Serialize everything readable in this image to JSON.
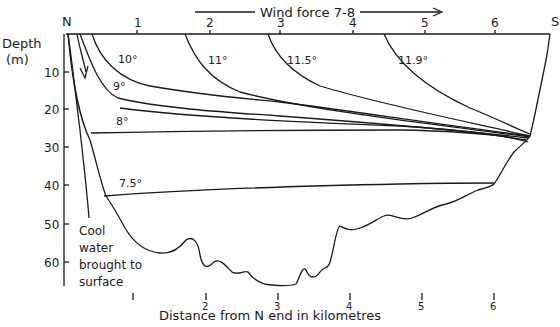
{
  "title": "Wind force 7-8",
  "compass": {
    "north": "N",
    "south": "S"
  },
  "y_axis": {
    "label_line1": "Depth",
    "label_line2": "(m)",
    "ticks": [
      "10",
      "20",
      "30",
      "40",
      "50",
      "60"
    ]
  },
  "x_axis": {
    "label": "Distance from N end in kilometres",
    "top_ticks": [
      "1",
      "2",
      "3",
      "4",
      "5",
      "6"
    ],
    "bottom_ticks": [
      "1",
      "2",
      "3",
      "4",
      "5",
      "6"
    ]
  },
  "isotherms": [
    {
      "label": "10°"
    },
    {
      "label": "9°"
    },
    {
      "label": "8°"
    },
    {
      "label": "7.5°"
    },
    {
      "label": "11°"
    },
    {
      "label": "11.5°"
    },
    {
      "label": "11.9°"
    }
  ],
  "annotation": {
    "line1": "Cool",
    "line2": "water",
    "line3": "brought to",
    "line4": "surface"
  },
  "colors": {
    "ink": "#1a1a1a",
    "background": "#ffffff"
  }
}
